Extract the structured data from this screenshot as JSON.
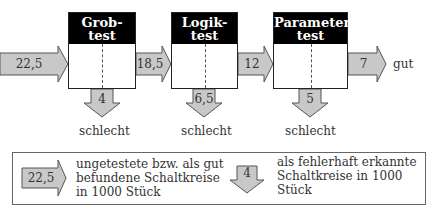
{
  "diagram": {
    "stages": [
      {
        "title_line1": "Grob-",
        "title_line2": "test",
        "in_value": "22,5",
        "reject_value": "4",
        "reject_label": "schlecht"
      },
      {
        "title_line1": "Logik-",
        "title_line2": "test",
        "in_value": "18,5",
        "reject_value": "6,5",
        "reject_label": "schlecht"
      },
      {
        "title_line1": "Parameter-",
        "title_line2": "test",
        "in_value": "12",
        "reject_value": "5",
        "reject_label": "schlecht"
      }
    ],
    "output": {
      "value": "7",
      "label": "gut"
    }
  },
  "legend": {
    "arrow_right_value": "22,5",
    "arrow_right_text": [
      "ungetestete bzw. als gut",
      "befundene Schaltkreise",
      "in 1000 Stück"
    ],
    "arrow_down_value": "4",
    "arrow_down_text": [
      "als fehlerhaft erkannte",
      "Schaltkreise in 1000",
      "Stück"
    ]
  },
  "colors": {
    "arrow_fill": "#c8c8c8",
    "arrow_stroke": "#555555",
    "header_bg": "#000000"
  }
}
